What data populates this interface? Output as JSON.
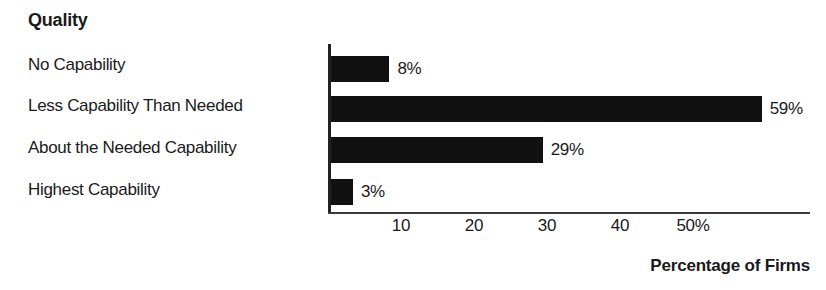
{
  "chart_data": {
    "type": "bar",
    "orientation": "horizontal",
    "title": "Quality",
    "categories": [
      "No Capability",
      "Less Capability Than Needed",
      "About the Needed Capability",
      "Highest Capability"
    ],
    "values": [
      8,
      59,
      29,
      3
    ],
    "value_labels": [
      "8%",
      "59%",
      "29%",
      "3%"
    ],
    "xlabel": "Percentage of Firms",
    "ylabel": "Quality",
    "xlim": [
      0,
      66
    ],
    "xticks": [
      10,
      20,
      30,
      40,
      50
    ],
    "xtick_labels": [
      "10",
      "20",
      "30",
      "40",
      "50%"
    ],
    "grid": false,
    "legend": false,
    "bar_color": "#111111",
    "axis_color": "#222222",
    "background_color": "#ffffff"
  },
  "layout": {
    "plot_left_px": 328,
    "plot_top_px": 44,
    "plot_width_px": 482,
    "plot_height_px": 168,
    "px_per_percent": 7.3,
    "bar_tops_px": [
      12,
      52,
      93,
      135
    ],
    "bar_height_px": 26
  }
}
